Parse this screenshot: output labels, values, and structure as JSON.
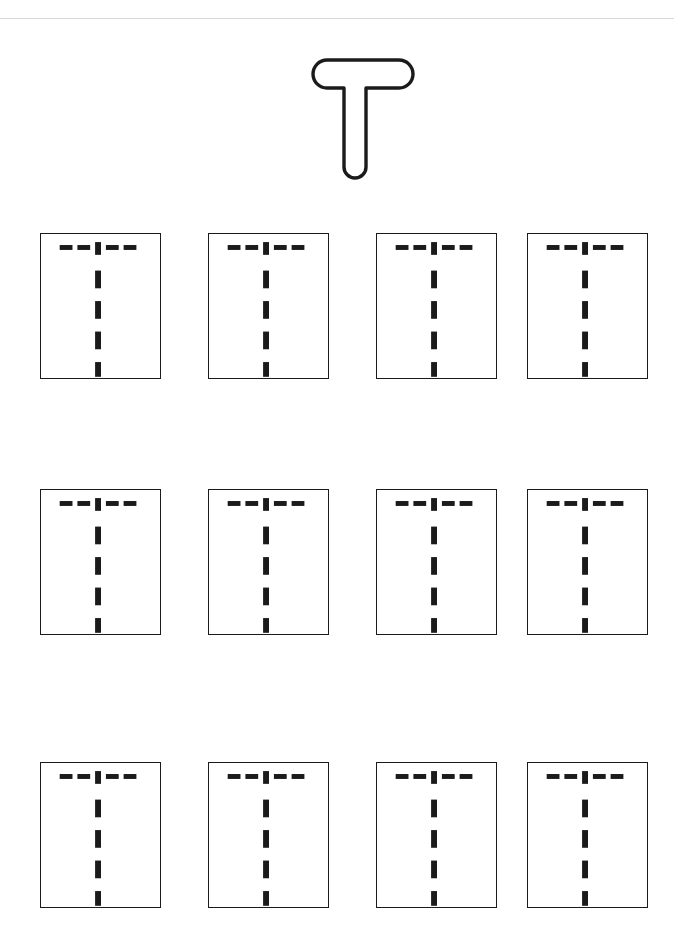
{
  "worksheet": {
    "letter": "T",
    "letter_name": "uppercase-letter-t",
    "title": "Letter T Tracing Practice",
    "model_letter_style": "outlined-hollow-rounded",
    "ink_color": "#1b1b1b",
    "box_border_color": "#1b1b1b",
    "rule_color": "#d8d9dc",
    "page_background": "#ffffff"
  },
  "top_rule": {
    "name": "header-rule",
    "label": ""
  },
  "model": {
    "name": "model-letter-t",
    "label": "T",
    "description": "Large hollow outline of capital letter T with rounded stroke ends",
    "crossbar": {
      "x1": 17,
      "x2": 101,
      "y": 22,
      "stroke_width": 28
    },
    "stem": {
      "x": 59,
      "y1": 22,
      "y2": 124,
      "stroke_width": 22
    }
  },
  "practice": {
    "name": "practice-grid",
    "rows": 3,
    "columns": 4,
    "total_boxes": 12,
    "guide_description": "Dashed tracing guide: horizontal bar of 4 short dashes plus center tick, and vertical stem of 5 dashes",
    "guide": {
      "bar_dashes": 4,
      "stem_dashes": 5,
      "dash_color": "#1b1b1b"
    },
    "boxes": [
      {
        "row": 0,
        "col": 0,
        "label": "practice-box-1"
      },
      {
        "row": 0,
        "col": 1,
        "label": "practice-box-2"
      },
      {
        "row": 0,
        "col": 2,
        "label": "practice-box-3"
      },
      {
        "row": 0,
        "col": 3,
        "label": "practice-box-4"
      },
      {
        "row": 1,
        "col": 0,
        "label": "practice-box-5"
      },
      {
        "row": 1,
        "col": 1,
        "label": "practice-box-6"
      },
      {
        "row": 1,
        "col": 2,
        "label": "practice-box-7"
      },
      {
        "row": 1,
        "col": 3,
        "label": "practice-box-8"
      },
      {
        "row": 2,
        "col": 0,
        "label": "practice-box-9"
      },
      {
        "row": 2,
        "col": 1,
        "label": "practice-box-10"
      },
      {
        "row": 2,
        "col": 2,
        "label": "practice-box-11"
      },
      {
        "row": 2,
        "col": 3,
        "label": "practice-box-12"
      }
    ]
  }
}
